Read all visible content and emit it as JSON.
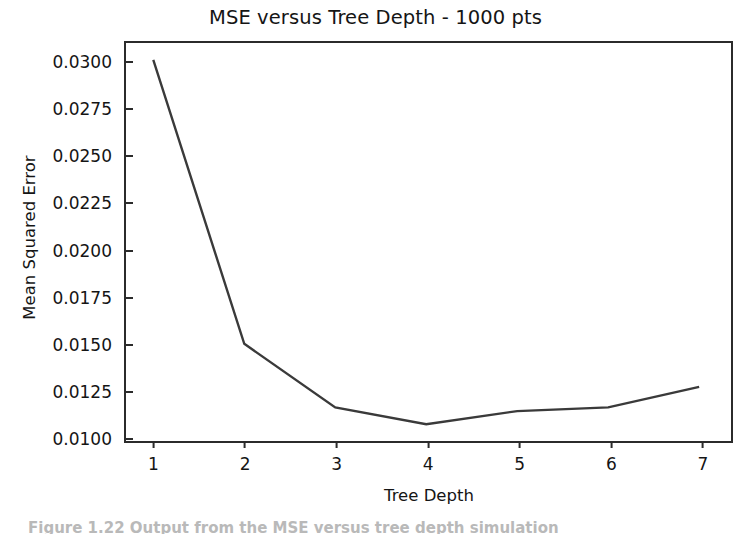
{
  "figure": {
    "title": "MSE versus Tree Depth - 1000 pts",
    "caption_remnant": "Figure 1.22   Output from the MSE versus tree depth simulation"
  },
  "chart_data": {
    "type": "line",
    "title": "MSE versus Tree Depth - 1000 pts",
    "xlabel": "Tree Depth",
    "ylabel": "Mean Squared Error",
    "x": [
      1,
      2,
      3,
      4,
      5,
      6,
      7
    ],
    "values": [
      0.0301,
      0.0149,
      0.0115,
      0.0106,
      0.0113,
      0.0115,
      0.0126
    ],
    "series": [
      {
        "name": "Mean Squared Error",
        "values": [
          0.0301,
          0.0149,
          0.0115,
          0.0106,
          0.0113,
          0.0115,
          0.0126
        ]
      }
    ],
    "xlim": [
      0.7,
      7.35
    ],
    "ylim": [
      0.0097,
      0.031
    ],
    "xticks": [
      "1",
      "2",
      "3",
      "4",
      "5",
      "6",
      "7"
    ],
    "xtick_values": [
      1,
      2,
      3,
      4,
      5,
      6,
      7
    ],
    "yticks": [
      "0.0100",
      "0.0125",
      "0.0150",
      "0.0175",
      "0.0200",
      "0.0225",
      "0.0250",
      "0.0275",
      "0.0300"
    ],
    "ytick_values": [
      0.01,
      0.0125,
      0.015,
      0.0175,
      0.02,
      0.0225,
      0.025,
      0.0275,
      0.03
    ],
    "grid": false,
    "legend": "none",
    "line_color": "#3a3a3a",
    "line_width": 2.4,
    "markers": "none",
    "background": "#ffffff",
    "frame_color": "#2b2b2b"
  }
}
